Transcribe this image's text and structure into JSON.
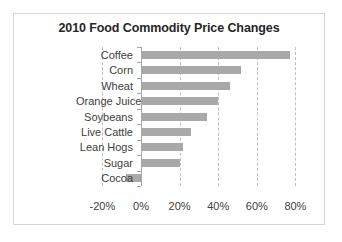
{
  "chart_data": {
    "type": "bar",
    "orientation": "horizontal",
    "title": "2010 Food Commodity Price Changes",
    "xlabel": "",
    "ylabel": "",
    "categories": [
      "Coffee",
      "Corn",
      "Wheat",
      "Orange Juice",
      "Soybeans",
      "Live Cattle",
      "Lean Hogs",
      "Sugar",
      "Cocoa"
    ],
    "values": [
      77,
      52,
      46,
      40,
      34,
      26,
      22,
      20,
      -8
    ],
    "value_unit": "percent",
    "xlim": [
      -20,
      80
    ],
    "xticks": [
      -20,
      0,
      20,
      40,
      60,
      80
    ],
    "xtick_labels": [
      "-20%",
      "0%",
      "20%",
      "40%",
      "60%",
      "80%"
    ],
    "grid": true,
    "grid_style": "dashed vertical",
    "legend": false,
    "bar_color": "#a9a9a9",
    "gridline_color": "#bfbfbf",
    "axis_color": "#a6a6a6",
    "border_color": "#d6d6d6",
    "title_color": "#262626",
    "label_color": "#404040"
  }
}
